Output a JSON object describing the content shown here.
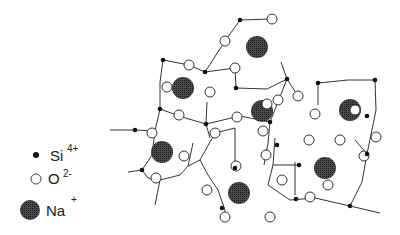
{
  "diagram": {
    "title": "",
    "type": "sodium silicate glass network (2D schematic)",
    "colors": {
      "bond": "#333333",
      "si": "#111111",
      "o_fill": "#ffffff",
      "o_stroke": "#333333",
      "na": "#3a3a3a"
    },
    "legend": [
      {
        "symbol": "si",
        "label": "Si",
        "charge": "4+"
      },
      {
        "symbol": "o",
        "label": "O",
        "charge": "2-"
      },
      {
        "symbol": "na",
        "label": "Na",
        "charge": "+"
      }
    ],
    "na_ions": [
      [
        257,
        47
      ],
      [
        183,
        88
      ],
      [
        262,
        111
      ],
      [
        350,
        110
      ],
      [
        162,
        152
      ],
      [
        325,
        168
      ],
      [
        239,
        193
      ]
    ],
    "si_atoms": [
      [
        240,
        20
      ],
      [
        163,
        60
      ],
      [
        205,
        72
      ],
      [
        236,
        88
      ],
      [
        287,
        79
      ],
      [
        318,
        83
      ],
      [
        375,
        80
      ],
      [
        160,
        109
      ],
      [
        206,
        124
      ],
      [
        270,
        122
      ],
      [
        367,
        116
      ],
      [
        135,
        130
      ],
      [
        142,
        170
      ],
      [
        235,
        168
      ],
      [
        277,
        145
      ],
      [
        299,
        165
      ],
      [
        367,
        154
      ],
      [
        222,
        208
      ],
      [
        296,
        199
      ],
      [
        350,
        206
      ]
    ],
    "o_atoms": [
      [
        272,
        19
      ],
      [
        225,
        41
      ],
      [
        189,
        65
      ],
      [
        235,
        68
      ],
      [
        167,
        87
      ],
      [
        210,
        92
      ],
      [
        179,
        115
      ],
      [
        237,
        117
      ],
      [
        315,
        114
      ],
      [
        355,
        110
      ],
      [
        152,
        133
      ],
      [
        184,
        156
      ],
      [
        215,
        133
      ],
      [
        263,
        131
      ],
      [
        266,
        155
      ],
      [
        309,
        140
      ],
      [
        340,
        140
      ],
      [
        298,
        96
      ],
      [
        236,
        166
      ],
      [
        282,
        180
      ],
      [
        270,
        217
      ],
      [
        310,
        197
      ],
      [
        156,
        178
      ],
      [
        207,
        190
      ],
      [
        225,
        217
      ],
      [
        328,
        185
      ],
      [
        376,
        137
      ],
      [
        267,
        104
      ],
      [
        364,
        156
      ],
      [
        278,
        100
      ]
    ],
    "bonds": [
      [
        [
          240,
          20
        ],
        [
          272,
          19
        ]
      ],
      [
        [
          240,
          20
        ],
        [
          225,
          41
        ]
      ],
      [
        [
          225,
          41
        ],
        [
          205,
          72
        ]
      ],
      [
        [
          163,
          60
        ],
        [
          189,
          65
        ]
      ],
      [
        [
          189,
          65
        ],
        [
          205,
          72
        ]
      ],
      [
        [
          205,
          72
        ],
        [
          235,
          68
        ]
      ],
      [
        [
          235,
          68
        ],
        [
          236,
          88
        ]
      ],
      [
        [
          236,
          88
        ],
        [
          267,
          89
        ]
      ],
      [
        [
          267,
          89
        ],
        [
          287,
          79
        ]
      ],
      [
        [
          287,
          79
        ],
        [
          281,
          62
        ]
      ],
      [
        [
          163,
          60
        ],
        [
          160,
          82
        ]
      ],
      [
        [
          160,
          82
        ],
        [
          160,
          109
        ]
      ],
      [
        [
          160,
          109
        ],
        [
          182,
          117
        ]
      ],
      [
        [
          182,
          117
        ],
        [
          206,
          124
        ]
      ],
      [
        [
          206,
          124
        ],
        [
          207,
          102
        ]
      ],
      [
        [
          206,
          124
        ],
        [
          240,
          116
        ]
      ],
      [
        [
          240,
          116
        ],
        [
          270,
          122
        ]
      ],
      [
        [
          270,
          122
        ],
        [
          268,
          143
        ]
      ],
      [
        [
          268,
          143
        ],
        [
          264,
          165
        ]
      ],
      [
        [
          270,
          122
        ],
        [
          287,
          79
        ]
      ],
      [
        [
          287,
          79
        ],
        [
          298,
          96
        ]
      ],
      [
        [
          160,
          109
        ],
        [
          155,
          131
        ]
      ],
      [
        [
          155,
          131
        ],
        [
          135,
          130
        ]
      ],
      [
        [
          135,
          130
        ],
        [
          110,
          130
        ]
      ],
      [
        [
          155,
          131
        ],
        [
          152,
          155
        ]
      ],
      [
        [
          152,
          155
        ],
        [
          142,
          170
        ]
      ],
      [
        [
          142,
          170
        ],
        [
          128,
          172
        ]
      ],
      [
        [
          142,
          170
        ],
        [
          148,
          178
        ]
      ],
      [
        [
          148,
          178
        ],
        [
          160,
          180
        ]
      ],
      [
        [
          160,
          180
        ],
        [
          180,
          175
        ]
      ],
      [
        [
          180,
          175
        ],
        [
          188,
          166
        ]
      ],
      [
        [
          188,
          166
        ],
        [
          200,
          160
        ]
      ],
      [
        [
          160,
          180
        ],
        [
          155,
          205
        ]
      ],
      [
        [
          188,
          166
        ],
        [
          193,
          143
        ]
      ],
      [
        [
          206,
          124
        ],
        [
          210,
          138
        ]
      ],
      [
        [
          200,
          160
        ],
        [
          215,
          133
        ]
      ],
      [
        [
          215,
          133
        ],
        [
          235,
          128
        ]
      ],
      [
        [
          200,
          160
        ],
        [
          208,
          175
        ]
      ],
      [
        [
          208,
          175
        ],
        [
          218,
          190
        ]
      ],
      [
        [
          218,
          190
        ],
        [
          225,
          210
        ]
      ],
      [
        [
          225,
          210
        ],
        [
          225,
          217
        ]
      ],
      [
        [
          235,
          128
        ],
        [
          235,
          168
        ]
      ],
      [
        [
          275,
          138
        ],
        [
          273,
          165
        ]
      ],
      [
        [
          273,
          165
        ],
        [
          299,
          165
        ]
      ],
      [
        [
          273,
          165
        ],
        [
          268,
          185
        ]
      ],
      [
        [
          268,
          185
        ],
        [
          290,
          200
        ]
      ],
      [
        [
          290,
          200
        ],
        [
          315,
          198
        ]
      ],
      [
        [
          315,
          198
        ],
        [
          350,
          206
        ]
      ],
      [
        [
          350,
          206
        ],
        [
          380,
          213
        ]
      ],
      [
        [
          295,
          162
        ],
        [
          295,
          195
        ]
      ],
      [
        [
          318,
          83
        ],
        [
          318,
          105
        ]
      ],
      [
        [
          318,
          83
        ],
        [
          348,
          80
        ]
      ],
      [
        [
          348,
          80
        ],
        [
          375,
          80
        ]
      ],
      [
        [
          375,
          80
        ],
        [
          376,
          110
        ]
      ],
      [
        [
          376,
          110
        ],
        [
          367,
          154
        ]
      ],
      [
        [
          367,
          154
        ],
        [
          355,
          140
        ]
      ],
      [
        [
          367,
          154
        ],
        [
          362,
          182
        ]
      ],
      [
        [
          362,
          182
        ],
        [
          350,
          206
        ]
      ]
    ]
  }
}
